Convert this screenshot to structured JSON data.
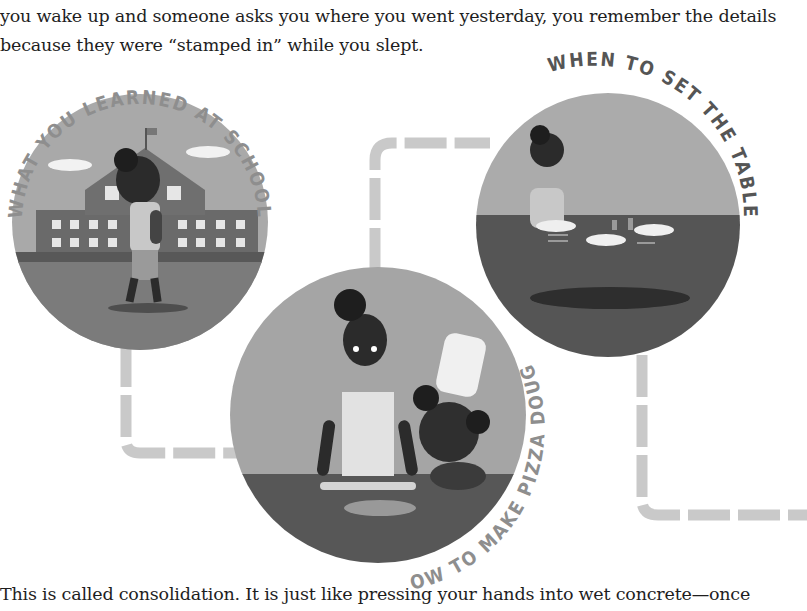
{
  "text": {
    "intro_line1": "you wake up and someone asks you where you went yesterday, you remember the details",
    "intro_line2": "because they were “stamped in” while you slept.",
    "outro": "This is called consolidation. It is just like pressing your hands into wet concrete—once"
  },
  "illustration": {
    "circles": [
      {
        "id": "school",
        "label": "WHAT YOU LEARNED AT SCHOOL",
        "scene": "girl walking past school building"
      },
      {
        "id": "pizza",
        "label": "HOW TO MAKE PIZZA DOUGH",
        "scene": "girl and child in chef hat rolling dough"
      },
      {
        "id": "table",
        "label": "WHEN TO SET THE TABLE",
        "scene": "girl setting plates on a table"
      }
    ],
    "colors": {
      "connector": "#c9c9c9",
      "label": "#8a8a8a",
      "label_dark": "#555555",
      "sky": "#a8a8a8",
      "ground": "#5f5f5f",
      "skin": "#2f2f2f"
    }
  }
}
